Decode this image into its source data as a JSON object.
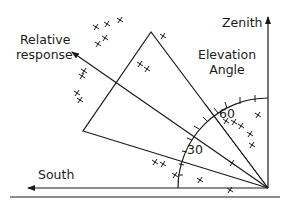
{
  "diagram": {
    "labels": {
      "zenith": "Zenith",
      "elevation_line1": "Elevation",
      "elevation_line2": "Angle",
      "relative_line1": "Relative",
      "relative_line2": "response",
      "south": "South",
      "tick_30": "30",
      "tick_60": "60"
    },
    "colors": {
      "ink": "#1a1a1a",
      "background": "#ffffff"
    },
    "geometry": {
      "origin": [
        268,
        187
      ],
      "arc_radius": 90,
      "arc_ticks_deg": [
        5,
        10,
        15,
        20,
        25,
        30,
        35,
        40,
        45,
        55,
        60,
        65,
        70,
        75,
        80
      ]
    },
    "data_points": [
      [
        120,
        20
      ],
      [
        96,
        27
      ],
      [
        107,
        24
      ],
      [
        105,
        38
      ],
      [
        98,
        44
      ],
      [
        84,
        71
      ],
      [
        82,
        76
      ],
      [
        77,
        93
      ],
      [
        80,
        100
      ],
      [
        140,
        64
      ],
      [
        147,
        69
      ],
      [
        163,
        36
      ],
      [
        226,
        121
      ],
      [
        234,
        122
      ],
      [
        241,
        126
      ],
      [
        250,
        134
      ],
      [
        258,
        115
      ],
      [
        252,
        145
      ],
      [
        232,
        163
      ],
      [
        155,
        162
      ],
      [
        163,
        164
      ],
      [
        175,
        175
      ],
      [
        200,
        180
      ],
      [
        230,
        190
      ]
    ]
  }
}
